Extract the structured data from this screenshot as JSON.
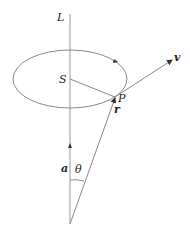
{
  "diagram": {
    "labels": {
      "axis": "L",
      "center": "S",
      "point": "P",
      "velocity": "v",
      "position": "r",
      "axis_vector": "a",
      "angle": "θ"
    },
    "colors": {
      "stroke": "#888888",
      "text": "#222222",
      "background": "#ffffff"
    }
  }
}
